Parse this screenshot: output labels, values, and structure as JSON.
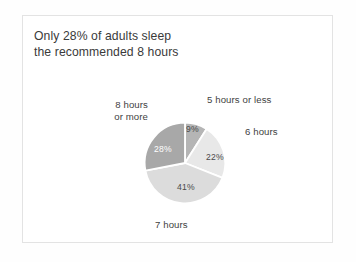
{
  "figure": {
    "title": "Only 28% of adults sleep\nthe recommended 8 hours",
    "background_color": "#fefefe",
    "card_background": "#ffffff",
    "card_border_color": "#e3e3e3",
    "title_color": "#3a3a3a",
    "label_color": "#3f3f3f"
  },
  "chart_data": {
    "type": "pie",
    "title": "Only 28% of adults sleep the recommended 8 hours",
    "xlabel": "",
    "ylabel": "",
    "unit": "percent",
    "legend": "none",
    "grid": false,
    "start_angle_deg": 0,
    "direction": "clockwise",
    "categories": [
      "5 hours or less",
      "6 hours",
      "7 hours",
      "8 hours or more"
    ],
    "values": [
      9,
      22,
      41,
      28
    ],
    "value_labels": [
      "9%",
      "22%",
      "41%",
      "28%"
    ],
    "colors": [
      "#b5b5b5",
      "#e8e8e8",
      "#dcdcdc",
      "#a8a8a8"
    ],
    "label_text_colors": [
      "#4a4a4a",
      "#4a4a4a",
      "#4a4a4a",
      "#ffffff"
    ],
    "slice_gap_color": "#ffffff",
    "annotations": [
      {
        "text": "5 hours or less",
        "position": "top-right"
      },
      {
        "text": "6 hours",
        "position": "right"
      },
      {
        "text": "7 hours",
        "position": "bottom"
      },
      {
        "text": "8 hours\nor more",
        "position": "top-left"
      }
    ]
  },
  "labels": {
    "cat0": "5 hours or less",
    "cat1": "6 hours",
    "cat2": "7 hours",
    "cat3": "8 hours\nor more",
    "pct0": "9%",
    "pct1": "22%",
    "pct2": "41%",
    "pct3": "28%"
  }
}
